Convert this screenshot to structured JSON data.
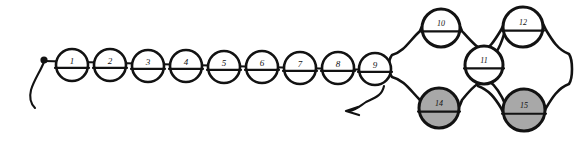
{
  "figure": {
    "kind": "hand-drawn-chain-diagram",
    "background_color": "#ffffff",
    "ink_color": "#121212",
    "shaded_fill_color": "#a8a8a8",
    "open_fill_color": "#ffffff",
    "width": 583,
    "height": 143
  },
  "nodes": [
    {
      "id": "1",
      "label": "1",
      "cx": 72,
      "cy": 65,
      "r": 16,
      "fill": "open",
      "divided": true,
      "group": "chain"
    },
    {
      "id": "2",
      "label": "2",
      "cx": 110,
      "cy": 65,
      "r": 16,
      "fill": "open",
      "divided": true,
      "group": "chain"
    },
    {
      "id": "3",
      "label": "3",
      "cx": 148,
      "cy": 66,
      "r": 16,
      "fill": "open",
      "divided": true,
      "group": "chain"
    },
    {
      "id": "4",
      "label": "4",
      "cx": 186,
      "cy": 66,
      "r": 16,
      "fill": "open",
      "divided": true,
      "group": "chain"
    },
    {
      "id": "5",
      "label": "5",
      "cx": 224,
      "cy": 67,
      "r": 16,
      "fill": "open",
      "divided": true,
      "group": "chain"
    },
    {
      "id": "6",
      "label": "6",
      "cx": 262,
      "cy": 67,
      "r": 16,
      "fill": "open",
      "divided": true,
      "group": "chain"
    },
    {
      "id": "7",
      "label": "7",
      "cx": 300,
      "cy": 68,
      "r": 16,
      "fill": "open",
      "divided": true,
      "group": "chain"
    },
    {
      "id": "8",
      "label": "8",
      "cx": 338,
      "cy": 68,
      "r": 16,
      "fill": "open",
      "divided": true,
      "group": "chain"
    },
    {
      "id": "9",
      "label": "9",
      "cx": 375,
      "cy": 69,
      "r": 16,
      "fill": "open",
      "divided": true,
      "group": "chain"
    },
    {
      "id": "10",
      "label": "10",
      "cx": 441,
      "cy": 28,
      "r": 19,
      "fill": "open",
      "divided": true,
      "group": "branch-left-top"
    },
    {
      "id": "11",
      "label": "11",
      "cx": 484,
      "cy": 65,
      "r": 19,
      "fill": "open",
      "divided": true,
      "group": "branch-middle"
    },
    {
      "id": "12",
      "label": "12",
      "cx": 523,
      "cy": 27,
      "r": 20,
      "fill": "open",
      "divided": true,
      "group": "branch-right-top"
    },
    {
      "id": "14",
      "label": "14",
      "cx": 439,
      "cy": 108,
      "r": 20,
      "fill": "shaded",
      "divided": true,
      "group": "branch-left-bottom"
    },
    {
      "id": "15",
      "label": "15",
      "cx": 524,
      "cy": 110,
      "r": 21,
      "fill": "shaded",
      "divided": true,
      "group": "branch-right-bottom"
    }
  ],
  "markers": [
    {
      "name": "start-dot",
      "cx": 44,
      "cy": 60,
      "r": 3.2,
      "description": "filled start dot at left end of chain"
    },
    {
      "name": "start-tail",
      "description": "short curved tail hanging down-left from the start dot"
    },
    {
      "name": "exit-arrow",
      "description": "S-curved arrow leaving below node 9 and pointing left",
      "direction": "left"
    }
  ],
  "edges": [
    {
      "from": "start-dot",
      "to": "1",
      "style": "tangent-chain"
    },
    {
      "from": "1",
      "to": "2",
      "style": "tangent-chain"
    },
    {
      "from": "2",
      "to": "3",
      "style": "tangent-chain"
    },
    {
      "from": "3",
      "to": "4",
      "style": "tangent-chain"
    },
    {
      "from": "4",
      "to": "5",
      "style": "tangent-chain"
    },
    {
      "from": "5",
      "to": "6",
      "style": "tangent-chain"
    },
    {
      "from": "6",
      "to": "7",
      "style": "tangent-chain"
    },
    {
      "from": "7",
      "to": "8",
      "style": "tangent-chain"
    },
    {
      "from": "8",
      "to": "9",
      "style": "tangent-chain"
    },
    {
      "from": "9",
      "to": "10",
      "style": "hourglass-connector"
    },
    {
      "from": "9",
      "to": "14",
      "style": "hourglass-connector"
    },
    {
      "from": "10",
      "to": "11",
      "style": "hourglass-connector"
    },
    {
      "from": "14",
      "to": "11",
      "style": "hourglass-connector"
    },
    {
      "from": "11",
      "to": "12",
      "style": "hourglass-connector"
    },
    {
      "from": "11",
      "to": "15",
      "style": "hourglass-connector"
    },
    {
      "from": "12",
      "to": "15",
      "style": "rounded-bypass-right"
    }
  ],
  "counts": {
    "total_nodes": 14,
    "open_nodes": 12,
    "shaded_nodes": 2
  }
}
